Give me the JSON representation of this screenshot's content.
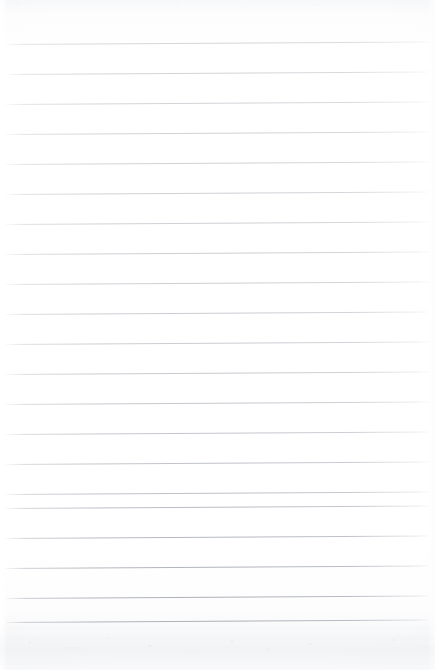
{
  "document": {
    "kind": "scanned-ruled-notepad-page",
    "title": "",
    "visible_text": "",
    "handwriting": "",
    "printed_text": "",
    "page_number": "",
    "notes": "Blank lined notepad sheet; no text, headings, numbers, logos or marks are rendered anywhere on the page."
  },
  "page": {
    "width_px": 435,
    "height_px": 670,
    "background_color": "#fdfdfe",
    "paper_color": "#ffffff"
  },
  "rules": {
    "count": 20,
    "color": "#b0b4bb",
    "thickness_px": 1,
    "spacing_px": 30,
    "first_line_y_px": 44,
    "left_x_px": 5,
    "right_x_px": 429,
    "skew_deg": -0.35,
    "lines": [
      {
        "index": 1,
        "y": 44,
        "opacity": 0.52
      },
      {
        "index": 2,
        "y": 74,
        "opacity": 0.55
      },
      {
        "index": 3,
        "y": 104,
        "opacity": 0.55
      },
      {
        "index": 4,
        "y": 134,
        "opacity": 0.58
      },
      {
        "index": 5,
        "y": 164,
        "opacity": 0.58
      },
      {
        "index": 6,
        "y": 194,
        "opacity": 0.6
      },
      {
        "index": 7,
        "y": 224,
        "opacity": 0.6
      },
      {
        "index": 8,
        "y": 254,
        "opacity": 0.62
      },
      {
        "index": 9,
        "y": 284,
        "opacity": 0.62
      },
      {
        "index": 10,
        "y": 314,
        "opacity": 0.65
      },
      {
        "index": 11,
        "y": 344,
        "opacity": 0.65
      },
      {
        "index": 12,
        "y": 374,
        "opacity": 0.68
      },
      {
        "index": 13,
        "y": 404,
        "opacity": 0.7
      },
      {
        "index": 14,
        "y": 434,
        "opacity": 0.72
      },
      {
        "index": 15,
        "y": 464,
        "opacity": 0.76
      },
      {
        "index": 16,
        "y": 494,
        "opacity": 0.8
      },
      {
        "index": 17,
        "y": 508,
        "opacity": 0.84
      },
      {
        "index": 18,
        "y": 538,
        "opacity": 0.9
      },
      {
        "index": 19,
        "y": 568,
        "opacity": 0.95
      },
      {
        "index": 20,
        "y": 598,
        "opacity": 1.0
      },
      {
        "index": 21,
        "y": 622,
        "opacity": 1.0
      }
    ]
  },
  "artifacts": {
    "top_speckle_band_height_px": 16,
    "bottom_speckle_band_height_px": 44,
    "left_margin_strip_px": 6,
    "right_margin_strip_px": 6,
    "speckle_color": "#c9ccd1",
    "shadow_color": "#eef0f2"
  }
}
